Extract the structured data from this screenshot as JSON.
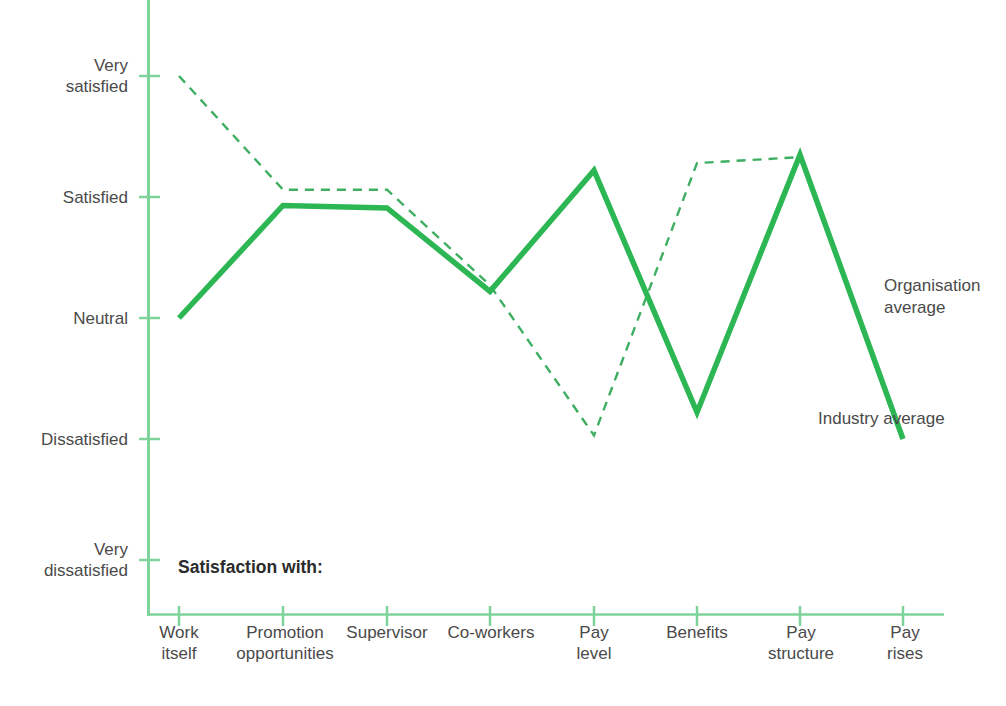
{
  "chart_data": {
    "type": "line",
    "title": "",
    "subtitle": "",
    "xlabel": "Satisfaction with:",
    "ylabel": "",
    "grid": false,
    "legend_position": "inline-right",
    "categories": [
      "Work\nitself",
      "Promotion\nopportunities",
      "Supervisor",
      "Co-workers",
      "Pay\nlevel",
      "Benefits",
      "Pay\nstructure",
      "Pay\nrises"
    ],
    "y_ticks": [
      "Very\nsatisfied",
      "Satisfied",
      "Neutral",
      "Dissatisfied",
      "Very\ndissatisfied"
    ],
    "y_tick_values": [
      5,
      4,
      3,
      2,
      1
    ],
    "ylim": [
      1,
      5
    ],
    "series": [
      {
        "name": "Industry average",
        "style": "solid",
        "color": "#2DB754",
        "values": [
          3.0,
          3.93,
          3.91,
          3.22,
          4.22,
          2.22,
          4.35,
          2.0
        ]
      },
      {
        "name": "Organisation average",
        "style": "dashed",
        "color": "#3FAE63",
        "values": [
          5.0,
          4.06,
          4.06,
          3.27,
          2.03,
          4.28,
          4.33,
          1.97
        ]
      }
    ],
    "annotations": [
      {
        "name": "satisfaction-with",
        "text": "Satisfaction with:"
      },
      {
        "name": "legend-organisation",
        "text": "Organisation\naverage"
      },
      {
        "name": "legend-industry",
        "text": "Industry\naverage"
      }
    ],
    "colors": {
      "axis": "#7ED39A",
      "line_solid": "#2DB754",
      "line_dashed": "#3FAE63",
      "text": "#4a4a4a",
      "background": "#ffffff"
    }
  }
}
